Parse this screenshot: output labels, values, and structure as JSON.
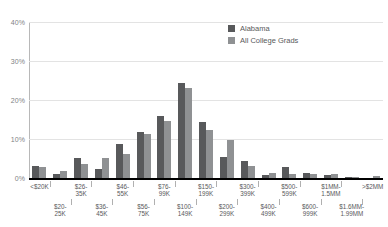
{
  "chart_data": {
    "type": "bar",
    "title": "",
    "xlabel": "",
    "ylabel": "",
    "ylim": [
      0,
      40
    ],
    "yticks": [
      "0%",
      "10%",
      "20%",
      "30%",
      "40%"
    ],
    "ytick_values": [
      0,
      10,
      20,
      30,
      40
    ],
    "grid": true,
    "legend_position": "top-right",
    "categories": [
      "<$20K",
      "$20-\n25K",
      "$26-\n35K",
      "$36-\n45K",
      "$46-\n55K",
      "$56-\n75K",
      "$76-\n99K",
      "$100-\n149K",
      "$150-\n199K",
      "$200-\n299K",
      "$300-\n399K",
      "$400-\n499K",
      "$500-\n599K",
      "$600-\n999K",
      "$1MM-\n1.5MM",
      "$1.6MM-\n1.99MM",
      ">$2MM"
    ],
    "series": [
      {
        "name": "Alabama",
        "color": "#58595b",
        "values": [
          3.2,
          1.0,
          5.1,
          2.3,
          8.7,
          11.9,
          15.9,
          24.3,
          14.3,
          5.5,
          4.3,
          0.8,
          2.7,
          1.3,
          0.8,
          0.1,
          0.0
        ]
      },
      {
        "name": "All College Grads",
        "color": "#8f9193",
        "values": [
          2.9,
          1.8,
          3.7,
          5.1,
          6.1,
          11.2,
          14.6,
          23.0,
          12.4,
          9.7,
          3.1,
          1.4,
          1.1,
          1.1,
          1.1,
          0.1,
          0.5
        ]
      }
    ]
  },
  "legend": {
    "items": [
      {
        "label": "Alabama",
        "color": "#58595b"
      },
      {
        "label": "All College Grads",
        "color": "#8f9193"
      }
    ]
  }
}
